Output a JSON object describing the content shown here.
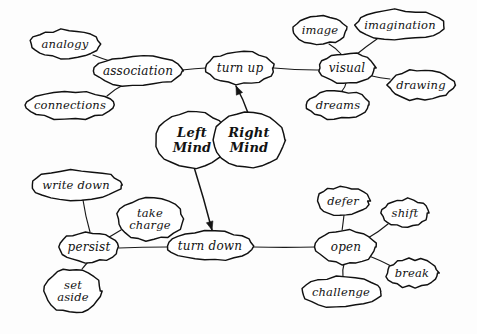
{
  "diagram": {
    "type": "mind-map",
    "background_color": "#fdfdfd",
    "ink_color": "#121212",
    "style": "hand-drawn ellipses with handwritten cursive labels"
  },
  "nodes": [
    {
      "id": "left-mind",
      "label": "Left\nMind",
      "cx": 192,
      "cy": 140,
      "rx": 36,
      "ry": 28,
      "kind": "core"
    },
    {
      "id": "right-mind",
      "label": "Right\nMind",
      "cx": 249,
      "cy": 140,
      "rx": 36,
      "ry": 28,
      "kind": "core"
    },
    {
      "id": "turn-up",
      "label": "turn up",
      "cx": 240,
      "cy": 68,
      "rx": 34,
      "ry": 16,
      "kind": "hub"
    },
    {
      "id": "turn-down",
      "label": "turn down",
      "cx": 210,
      "cy": 246,
      "rx": 43,
      "ry": 15,
      "kind": "hub"
    },
    {
      "id": "association",
      "label": "association",
      "cx": 138,
      "cy": 71,
      "rx": 44,
      "ry": 15,
      "kind": "hub"
    },
    {
      "id": "analogy",
      "label": "analogy",
      "cx": 65,
      "cy": 44,
      "rx": 35,
      "ry": 14,
      "kind": "leaf"
    },
    {
      "id": "connections",
      "label": "connections",
      "cx": 70,
      "cy": 105,
      "rx": 45,
      "ry": 14,
      "kind": "leaf"
    },
    {
      "id": "visual",
      "label": "visual",
      "cx": 347,
      "cy": 68,
      "rx": 28,
      "ry": 15,
      "kind": "hub"
    },
    {
      "id": "image",
      "label": "image",
      "cx": 320,
      "cy": 30,
      "rx": 27,
      "ry": 14,
      "kind": "leaf"
    },
    {
      "id": "imagination",
      "label": "imagination",
      "cx": 400,
      "cy": 25,
      "rx": 44,
      "ry": 15,
      "kind": "leaf"
    },
    {
      "id": "drawing",
      "label": "drawing",
      "cx": 421,
      "cy": 85,
      "rx": 33,
      "ry": 15,
      "kind": "leaf"
    },
    {
      "id": "dreams",
      "label": "dreams",
      "cx": 338,
      "cy": 105,
      "rx": 31,
      "ry": 14,
      "kind": "leaf"
    },
    {
      "id": "persist",
      "label": "persist",
      "cx": 89,
      "cy": 247,
      "rx": 30,
      "ry": 15,
      "kind": "hub"
    },
    {
      "id": "write-down",
      "label": "write down",
      "cx": 76,
      "cy": 185,
      "rx": 45,
      "ry": 15,
      "kind": "leaf"
    },
    {
      "id": "take-charge",
      "label": "take\ncharge",
      "cx": 150,
      "cy": 219,
      "rx": 33,
      "ry": 21,
      "kind": "leaf"
    },
    {
      "id": "set-aside",
      "label": "set\naside",
      "cx": 73,
      "cy": 291,
      "rx": 28,
      "ry": 22,
      "kind": "leaf"
    },
    {
      "id": "open",
      "label": "open",
      "cx": 346,
      "cy": 247,
      "rx": 30,
      "ry": 17,
      "kind": "hub"
    },
    {
      "id": "defer",
      "label": "defer",
      "cx": 343,
      "cy": 201,
      "rx": 26,
      "ry": 14,
      "kind": "leaf"
    },
    {
      "id": "shift",
      "label": "shift",
      "cx": 405,
      "cy": 213,
      "rx": 23,
      "ry": 14,
      "kind": "leaf"
    },
    {
      "id": "break",
      "label": "break",
      "cx": 412,
      "cy": 273,
      "rx": 26,
      "ry": 14,
      "kind": "leaf"
    },
    {
      "id": "challenge",
      "label": "challenge",
      "cx": 341,
      "cy": 292,
      "rx": 40,
      "ry": 15,
      "kind": "leaf"
    }
  ],
  "edges": [
    {
      "from": "analogy",
      "to": "association",
      "x1": 93,
      "y1": 55,
      "x2": 113,
      "y2": 62,
      "kind": "line"
    },
    {
      "from": "connections",
      "to": "association",
      "x1": 107,
      "y1": 96,
      "x2": 125,
      "y2": 84,
      "kind": "line"
    },
    {
      "from": "association",
      "to": "turn-up",
      "x1": 182,
      "y1": 70,
      "x2": 206,
      "y2": 68,
      "kind": "line"
    },
    {
      "from": "turn-up",
      "to": "visual",
      "x1": 274,
      "y1": 68,
      "x2": 319,
      "y2": 70,
      "kind": "line"
    },
    {
      "from": "image",
      "to": "visual",
      "x1": 329,
      "y1": 44,
      "x2": 341,
      "y2": 54,
      "kind": "line"
    },
    {
      "from": "imagination",
      "to": "visual",
      "x1": 377,
      "y1": 39,
      "x2": 357,
      "y2": 54,
      "kind": "line"
    },
    {
      "from": "drawing",
      "to": "visual",
      "x1": 390,
      "y1": 79,
      "x2": 372,
      "y2": 76,
      "kind": "line"
    },
    {
      "from": "dreams",
      "to": "visual",
      "x1": 342,
      "y1": 91,
      "x2": 346,
      "y2": 83,
      "kind": "line"
    },
    {
      "from": "right-mind",
      "to": "turn-up",
      "x1": 248,
      "y1": 113,
      "x2": 236,
      "y2": 86,
      "kind": "arrow"
    },
    {
      "from": "left-mind",
      "to": "turn-down",
      "x1": 194,
      "y1": 167,
      "x2": 212,
      "y2": 230,
      "kind": "arrow"
    },
    {
      "from": "write-down",
      "to": "persist",
      "x1": 83,
      "y1": 200,
      "x2": 90,
      "y2": 232,
      "kind": "line"
    },
    {
      "from": "take-charge",
      "to": "persist",
      "x1": 121,
      "y1": 230,
      "x2": 104,
      "y2": 240,
      "kind": "line"
    },
    {
      "from": "set-aside",
      "to": "persist",
      "x1": 82,
      "y1": 269,
      "x2": 88,
      "y2": 262,
      "kind": "line"
    },
    {
      "from": "persist",
      "to": "turn-down",
      "x1": 119,
      "y1": 248,
      "x2": 167,
      "y2": 247,
      "kind": "line"
    },
    {
      "from": "turn-down",
      "to": "open",
      "x1": 253,
      "y1": 247,
      "x2": 316,
      "y2": 247,
      "kind": "line"
    },
    {
      "from": "defer",
      "to": "open",
      "x1": 344,
      "y1": 215,
      "x2": 342,
      "y2": 231,
      "kind": "line"
    },
    {
      "from": "shift",
      "to": "open",
      "x1": 388,
      "y1": 224,
      "x2": 368,
      "y2": 238,
      "kind": "line"
    },
    {
      "from": "break",
      "to": "open",
      "x1": 391,
      "y1": 266,
      "x2": 369,
      "y2": 256,
      "kind": "line"
    },
    {
      "from": "challenge",
      "to": "open",
      "x1": 343,
      "y1": 277,
      "x2": 344,
      "y2": 264,
      "kind": "line"
    }
  ]
}
